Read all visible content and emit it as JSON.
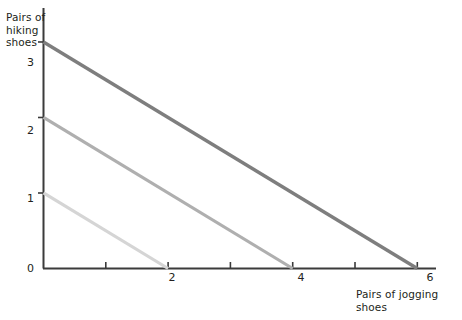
{
  "chart_data": {
    "type": "line",
    "title": "",
    "xlabel": "Pairs of jogging shoes",
    "ylabel": "Pairs of hiking shoes",
    "xlim": [
      0,
      6.3
    ],
    "ylim": [
      0,
      3.45
    ],
    "grid": false,
    "legend": "none",
    "x_ticks": [
      {
        "value": 0,
        "label": "0",
        "major": true
      },
      {
        "value": 1,
        "label": "",
        "major": false
      },
      {
        "value": 2,
        "label": "2",
        "major": true
      },
      {
        "value": 3,
        "label": "",
        "major": false
      },
      {
        "value": 4,
        "label": "4",
        "major": true
      },
      {
        "value": 5,
        "label": "",
        "major": false
      },
      {
        "value": 6,
        "label": "6",
        "major": true
      }
    ],
    "y_ticks": [
      {
        "value": 0,
        "label": "0",
        "major": true
      },
      {
        "value": 1,
        "label": "1",
        "major": true
      },
      {
        "value": 2,
        "label": "2",
        "major": true
      },
      {
        "value": 3,
        "label": "3",
        "major": true
      }
    ],
    "series": [
      {
        "name": "budget-line-low",
        "color": "#d5d5d5",
        "width": 3.2,
        "x": [
          0,
          2
        ],
        "y": [
          1,
          0
        ],
        "y_intercept": 1,
        "x_intercept": 2,
        "slope": -0.5
      },
      {
        "name": "budget-line-mid",
        "color": "#afafaf",
        "width": 3.2,
        "x": [
          0,
          4
        ],
        "y": [
          2,
          0
        ],
        "y_intercept": 2,
        "x_intercept": 4,
        "slope": -0.5
      },
      {
        "name": "budget-line-high",
        "color": "#7e7e7e",
        "width": 3.4,
        "x": [
          0,
          6
        ],
        "y": [
          3,
          0
        ],
        "y_intercept": 3,
        "x_intercept": 6,
        "slope": -0.5
      }
    ],
    "axis_color": "#3b3b3b",
    "text_color": "#231f20",
    "background": "#ffffff"
  },
  "labels": {
    "y_axis_title": "Pairs of\nhiking\nshoes",
    "x_axis_title": "Pairs of jogging shoes",
    "y_tick_0": "0",
    "y_tick_1": "1",
    "y_tick_2": "2",
    "y_tick_3": "3",
    "x_tick_2": "2",
    "x_tick_4": "4",
    "x_tick_6": "6"
  }
}
